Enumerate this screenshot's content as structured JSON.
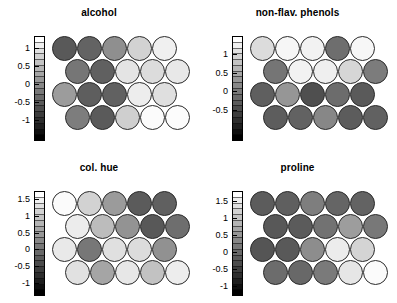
{
  "figure": {
    "type": "som-component-planes",
    "background": "#ffffff",
    "panel_count": 4,
    "grid_rows": 4,
    "grid_cols": 5,
    "grid_topology": "hexagonal",
    "colorbar_scheme": "grayscale-white-to-black",
    "colorbar_high": "#ffffff",
    "colorbar_low": "#000000"
  },
  "chart_data": {
    "type": "heatmap",
    "title": "",
    "panels": [
      {
        "title": "alcohol",
        "colorbar": {
          "ticks": [
            1,
            0.5,
            0,
            -0.5,
            -1
          ],
          "tick_labels": [
            "1",
            "0.5",
            "0",
            "-0.5",
            "-1"
          ],
          "vmin": -1.6,
          "vmax": 1.35
        },
        "rows": [
          {
            "offset": 0,
            "values": [
              -1.15,
              -0.95,
              -0.1,
              0.7,
              1.2
            ],
            "shades": [
              "#595959",
              "#636363",
              "#8f8f8f",
              "#d2d2d2",
              "#f0f0f0"
            ]
          },
          {
            "offset": 0.5,
            "values": [
              -0.75,
              -1.05,
              0.95,
              0.85,
              1.05
            ],
            "shades": [
              "#767676",
              "#606060",
              "#e4e4e4",
              "#dcdcdc",
              "#e8e8e8"
            ]
          },
          {
            "offset": 0,
            "values": [
              -0.35,
              -1.05,
              -1.0,
              1.15,
              0.9
            ],
            "shades": [
              "#9c9c9c",
              "#5e5e5e",
              "#616161",
              "#ededed",
              "#dfdfdf"
            ]
          },
          {
            "offset": 0.5,
            "values": [
              -0.7,
              -1.1,
              0.6,
              1.3,
              1.3
            ],
            "shades": [
              "#7d7d7d",
              "#5a5a5a",
              "#cfcfcf",
              "#fbfbfb",
              "#fcfcfc"
            ]
          }
        ]
      },
      {
        "title": "non-flav. phenols",
        "colorbar": {
          "ticks": [
            1,
            0.5,
            0,
            -0.5
          ],
          "tick_labels": [
            "1",
            "0.5",
            "0",
            "-0.5"
          ],
          "vmin": -1.35,
          "vmax": 1.5
        },
        "rows": [
          {
            "offset": 0,
            "values": [
              1.0,
              1.4,
              1.35,
              -0.35,
              1.4
            ],
            "shades": [
              "#dcdcdc",
              "#f6f6f6",
              "#f2f2f2",
              "#6e6e6e",
              "#f7f7f7"
            ]
          },
          {
            "offset": 0.5,
            "values": [
              -0.3,
              1.35,
              1.3,
              0.95,
              -0.25
            ],
            "shades": [
              "#757575",
              "#f2f2f2",
              "#efefef",
              "#d6d6d6",
              "#7c7c7c"
            ]
          },
          {
            "offset": 0,
            "values": [
              -0.7,
              0.0,
              -0.95,
              -0.4,
              -0.8
            ],
            "shades": [
              "#5f5f5f",
              "#969696",
              "#4f4f4f",
              "#6c6c6c",
              "#5a5a5a"
            ]
          },
          {
            "offset": 0.5,
            "values": [
              -0.75,
              -0.7,
              -0.15,
              -0.75,
              -0.7
            ],
            "shades": [
              "#5d5d5d",
              "#626262",
              "#878787",
              "#5c5c5c",
              "#616161"
            ]
          }
        ]
      },
      {
        "title": "col. hue",
        "colorbar": {
          "ticks": [
            1.5,
            1,
            0.5,
            0,
            -0.5,
            -1
          ],
          "tick_labels": [
            "1.5",
            "1",
            "0.5",
            "0",
            "-0.5",
            "-1"
          ],
          "vmin": -1.4,
          "vmax": 1.75
        },
        "rows": [
          {
            "offset": 0,
            "values": [
              1.5,
              0.85,
              0.05,
              -0.85,
              -0.8
            ],
            "shades": [
              "#fbfbfb",
              "#d2d2d2",
              "#9b9b9b",
              "#5b5b5b",
              "#606060"
            ]
          },
          {
            "offset": 0.5,
            "values": [
              1.25,
              0.45,
              -0.1,
              -0.9,
              -0.6
            ],
            "shades": [
              "#ececec",
              "#bcbcbc",
              "#939393",
              "#585858",
              "#6e6e6e"
            ]
          },
          {
            "offset": 0,
            "values": [
              1.2,
              -0.45,
              1.05,
              1.0,
              -0.1
            ],
            "shades": [
              "#e9e9e9",
              "#777777",
              "#e0e0e0",
              "#dcdcdc",
              "#919191"
            ]
          },
          {
            "offset": 0.5,
            "values": [
              1.05,
              0.15,
              1.15,
              0.55,
              1.25
            ],
            "shades": [
              "#e1e1e1",
              "#a5a5a5",
              "#e7e7e7",
              "#c2c2c2",
              "#ededed"
            ]
          }
        ]
      },
      {
        "title": "proline",
        "colorbar": {
          "ticks": [
            1.5,
            1,
            0.5,
            0,
            -0.5,
            -1
          ],
          "tick_labels": [
            "1.5",
            "1",
            "0.5",
            "0",
            "-0.5",
            "-1"
          ],
          "vmin": -1.3,
          "vmax": 1.8
        },
        "rows": [
          {
            "offset": 0,
            "values": [
              -0.85,
              -0.8,
              -0.35,
              -0.7,
              -0.75
            ],
            "shades": [
              "#5c5c5c",
              "#5f5f5f",
              "#7e7e7e",
              "#656565",
              "#636363"
            ]
          },
          {
            "offset": 0.5,
            "values": [
              -0.9,
              -0.85,
              -0.5,
              0.1,
              -0.45
            ],
            "shades": [
              "#585858",
              "#5b5b5b",
              "#727272",
              "#9d9d9d",
              "#787878"
            ]
          },
          {
            "offset": 0,
            "values": [
              -0.95,
              -0.9,
              -0.05,
              1.2,
              0.85
            ],
            "shades": [
              "#555555",
              "#595959",
              "#8d8d8d",
              "#ececec",
              "#d4d4d4"
            ]
          },
          {
            "offset": 0.5,
            "values": [
              -0.6,
              -0.65,
              -0.3,
              1.1,
              1.55
            ],
            "shades": [
              "#6c6c6c",
              "#686868",
              "#7a7a7a",
              "#e6e6e6",
              "#fbfbfb"
            ]
          }
        ]
      }
    ]
  }
}
